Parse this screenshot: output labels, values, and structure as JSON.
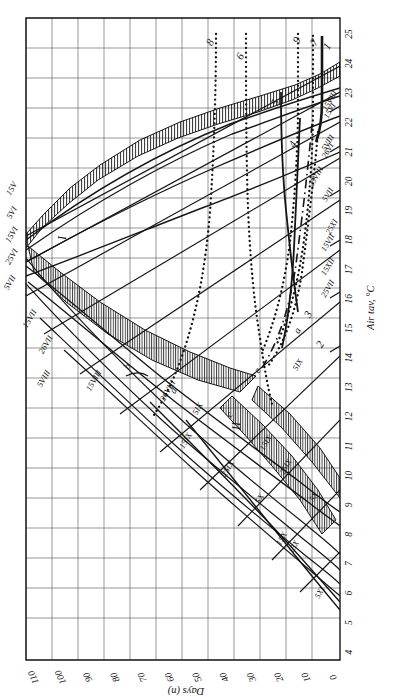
{
  "figure": {
    "orientation": "rotated-90-ccw",
    "type": "nomogram",
    "background_color": "#ffffff",
    "line_color": "#141414"
  },
  "axes": {
    "x": {
      "title": "Air tav, °C",
      "ticks": [
        "4",
        "5",
        "6",
        "7",
        "8",
        "9",
        "10",
        "11",
        "12",
        "13",
        "14",
        "15",
        "16",
        "17",
        "18",
        "19",
        "20",
        "21",
        "22",
        "23",
        "24",
        "25"
      ],
      "min": 4,
      "max": 25
    },
    "y": {
      "title": "Days (n)",
      "ticks": [
        "0",
        "10",
        "20",
        "30",
        "40",
        "50",
        "60",
        "70",
        "80",
        "90",
        "100",
        "110"
      ],
      "min": 0,
      "max": 115
    }
  },
  "regions": [
    {
      "id": "region-I",
      "label": "I"
    },
    {
      "id": "region-II",
      "label": "II"
    }
  ],
  "curve_numbers": [
    "1",
    "2",
    "3",
    "4",
    "5",
    "6",
    "7",
    "8",
    "9"
  ],
  "point_labels": [
    "a",
    "b",
    "c",
    "d",
    "e"
  ],
  "date_labels_left": [
    "15V",
    "5VI",
    "15VI",
    "25VI",
    "5VII",
    "15VII",
    "26VII",
    "5VIII",
    "15VIII",
    "26VIII",
    "5IX",
    "15IX",
    "25IX",
    "5X",
    "15X"
  ],
  "date_labels_right": [
    "15VI",
    "26VI",
    "5VII",
    "15VII",
    "25VII",
    "5VIII",
    "15VIII",
    "25VIII",
    "5IX",
    "15IX",
    "25IX",
    "5X",
    "15X",
    "25XI",
    "15XII",
    "5XI"
  ],
  "chart_data": {
    "type": "line",
    "title": "",
    "xlabel": "Air tav, °C",
    "ylabel": "Days (n)",
    "xlim": [
      4,
      25
    ],
    "ylim": [
      0,
      115
    ],
    "grid": true,
    "legend": "none",
    "xticks": [
      4,
      5,
      6,
      7,
      8,
      9,
      10,
      11,
      12,
      13,
      14,
      15,
      16,
      17,
      18,
      19,
      20,
      21,
      22,
      23,
      24,
      25
    ],
    "yticks": [
      0,
      10,
      20,
      30,
      40,
      50,
      60,
      70,
      80,
      90,
      100,
      110
    ],
    "series": [
      {
        "name": "1",
        "style": "solid-thick",
        "x": [
          23.0,
          23.2,
          23.4,
          23.6,
          23.8,
          24.0,
          24.3,
          24.6,
          25.0
        ],
        "y": [
          36,
          45,
          55,
          66,
          78,
          88,
          100,
          108,
          113
        ]
      },
      {
        "name": "2",
        "style": "dotted",
        "x": [
          14.2,
          16.0,
          18.0,
          20.0,
          21.5,
          22.4,
          22.8,
          23.0,
          23.1
        ],
        "y": [
          30,
          38,
          48,
          60,
          72,
          84,
          96,
          106,
          113
        ]
      },
      {
        "name": "3",
        "style": "dash-dot",
        "x": [
          13.6,
          15.5,
          17.5,
          19.5,
          21.0,
          22.0,
          22.5,
          22.8
        ],
        "y": [
          28,
          36,
          46,
          58,
          70,
          82,
          94,
          104
        ]
      },
      {
        "name": "4",
        "style": "solid",
        "x": [
          13.0,
          15.0,
          17.0,
          19.0,
          20.6,
          21.6,
          22.1,
          22.4
        ],
        "y": [
          26,
          34,
          44,
          56,
          68,
          80,
          92,
          102
        ]
      },
      {
        "name": "5",
        "style": "solid",
        "x": [
          12.0,
          14.5,
          17.0,
          19.5,
          21.0,
          22.0,
          22.6,
          23.0
        ],
        "y": [
          22,
          32,
          44,
          58,
          72,
          86,
          98,
          106
        ]
      },
      {
        "name": "6",
        "style": "dotted",
        "x": [
          10.5,
          13.0,
          15.5,
          18.0,
          19.6,
          20.4,
          20.8,
          20.9
        ],
        "y": [
          18,
          28,
          42,
          58,
          74,
          90,
          104,
          113
        ]
      },
      {
        "name": "7",
        "style": "dotted",
        "x": [
          14.0,
          16.5,
          19.0,
          21.0,
          22.2,
          22.8,
          23.1,
          23.2
        ],
        "y": [
          25,
          33,
          44,
          58,
          74,
          92,
          106,
          115
        ]
      },
      {
        "name": "8",
        "style": "dotted",
        "x": [
          9.0,
          11.5,
          14.5,
          17.0,
          18.5,
          19.3,
          19.6,
          19.7
        ],
        "y": [
          15,
          25,
          40,
          56,
          74,
          92,
          106,
          115
        ]
      },
      {
        "name": "9",
        "style": "dotted",
        "x": [
          13.5,
          16.0,
          18.5,
          20.5,
          21.8,
          22.4,
          22.7,
          22.8
        ],
        "y": [
          22,
          30,
          42,
          58,
          76,
          94,
          108,
          115
        ]
      }
    ],
    "envelope_upper": {
      "x": [
        4,
        6,
        8,
        10,
        12,
        14,
        16,
        18,
        20,
        22,
        23,
        24,
        25
      ],
      "y": [
        58,
        70,
        80,
        89,
        96,
        101,
        104,
        106,
        106,
        104,
        100,
        94,
        86
      ]
    },
    "envelope_lower": {
      "x": [
        4,
        6,
        8,
        10,
        12,
        14,
        16,
        18,
        20,
        22,
        23,
        24,
        25
      ],
      "y": [
        52,
        63,
        72,
        80,
        86,
        90,
        92,
        93,
        92,
        89,
        84,
        78,
        70
      ]
    }
  }
}
